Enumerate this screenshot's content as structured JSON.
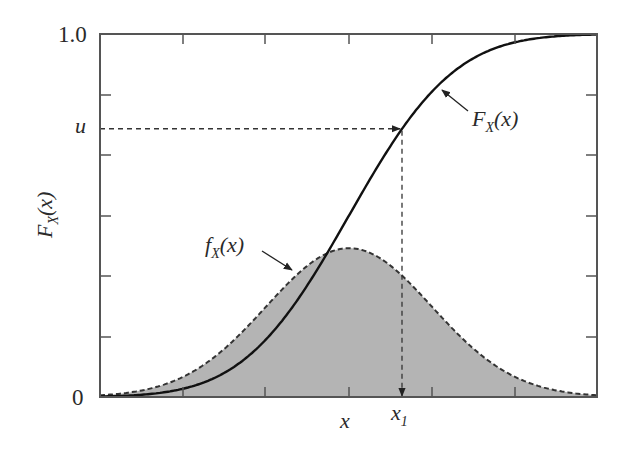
{
  "chart_data": {
    "type": "line",
    "title": "",
    "xlabel": "x",
    "ylabel": "F_X(x)",
    "ylim": [
      0,
      1.0
    ],
    "y_tick_labels": [
      "0",
      "u",
      "1.0"
    ],
    "x_tick_labels": [
      "x",
      "x1"
    ],
    "grid": false,
    "legend": "none (inline annotations)",
    "distribution": {
      "family": "normal",
      "mean_x_px": 349,
      "sigma_px": 83
    },
    "u_value": 0.74,
    "x1_position_z": 0.64,
    "series": [
      {
        "name": "F_X(x)",
        "style": "solid",
        "role": "CDF",
        "x_z": [
          -3,
          -2,
          -1,
          0,
          0.64,
          1,
          2,
          3
        ],
        "values": [
          0.001,
          0.023,
          0.159,
          0.5,
          0.739,
          0.841,
          0.977,
          0.999
        ]
      },
      {
        "name": "f_X(x)",
        "style": "dashed",
        "fill": "#b4b4b4",
        "role": "PDF (scaled, peak ≈ 0.41 of axis height)",
        "x_z": [
          -3,
          -2,
          -1,
          0,
          1,
          2,
          3
        ],
        "values": [
          0.005,
          0.055,
          0.249,
          0.41,
          0.249,
          0.055,
          0.005
        ]
      }
    ]
  },
  "plot": {
    "frame": {
      "left": 100,
      "top": 34,
      "right": 597,
      "bottom": 397
    },
    "x_ticks_px": [
      183,
      265,
      349,
      432,
      515
    ],
    "y_ticks_px": [
      95,
      155,
      216,
      276,
      337
    ],
    "mean_px": 349,
    "sigma_px": 83,
    "pdf_peak_frac": 0.41,
    "u_frac": 0.739,
    "x1_px": 402,
    "colors": {
      "axis": "#555555",
      "curve": "#111111",
      "fill": "#b4b4b4",
      "dash": "#333333"
    }
  },
  "labels": {
    "y_top": "1.0",
    "y_zero": "0",
    "y_u": "u",
    "x_mean": "x",
    "x1_main": "x",
    "x1_sub": "1",
    "ylabel_main": "F",
    "ylabel_sub": "X",
    "ylabel_arg": "(x)",
    "cdf_main": "F",
    "cdf_sub": "X",
    "cdf_arg": "(x)",
    "pdf_main": "f",
    "pdf_sub": "X",
    "pdf_arg": "(x)"
  }
}
